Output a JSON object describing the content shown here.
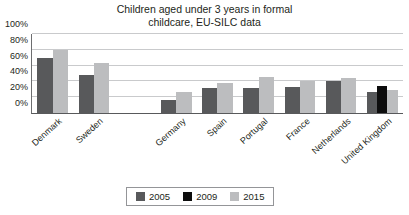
{
  "chart_data": {
    "type": "bar",
    "title": "Children aged under 3 years in formal\nchildcare, EU-SILC data",
    "xlabel": "",
    "ylabel": "",
    "ylim": [
      0,
      100
    ],
    "yticks": [
      "0%",
      "20%",
      "40%",
      "60%",
      "80%",
      "100%"
    ],
    "ytick_values": [
      0,
      20,
      40,
      60,
      80,
      100
    ],
    "grid": true,
    "legend_position": "bottom",
    "categories": [
      "Denmark",
      "Sweden",
      "",
      "Germany",
      "Spain",
      "Portugal",
      "France",
      "Netherlands",
      "United Kingdom"
    ],
    "series": [
      {
        "name": "2005",
        "color": "#58595b",
        "values": [
          70,
          48,
          null,
          17,
          32,
          32,
          33,
          41,
          26
        ]
      },
      {
        "name": "2009",
        "color": "#0d0d0d",
        "values": [
          null,
          null,
          null,
          null,
          null,
          null,
          null,
          null,
          34
        ]
      },
      {
        "name": "2015",
        "color": "#bcbdbf",
        "values": [
          80,
          63,
          null,
          26,
          38,
          46,
          40,
          44,
          29
        ]
      }
    ]
  },
  "legend": {
    "items": [
      {
        "label": "2005",
        "color": "#58595b"
      },
      {
        "label": "2009",
        "color": "#0d0d0d"
      },
      {
        "label": "2015",
        "color": "#bcbdbf"
      }
    ]
  }
}
